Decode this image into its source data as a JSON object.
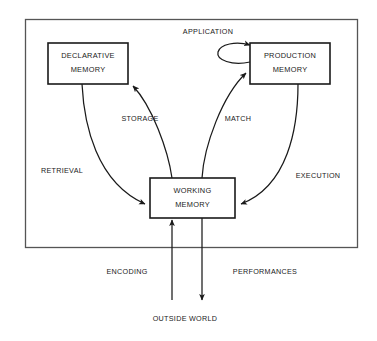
{
  "diagram": {
    "boundary": {
      "name": "cognitive-system-boundary"
    },
    "colors": {
      "background": "#ffffff",
      "box_stroke": "#1a1a1a",
      "boundary_stroke": "#555555",
      "arrow": "#1a1a1a",
      "text": "#1a1a1a"
    },
    "nodes": [
      {
        "id": "declarative-memory",
        "line1": "DECLARATIVE",
        "line2": "MEMORY",
        "x": 48,
        "y": 43,
        "w": 80,
        "h": 41
      },
      {
        "id": "production-memory",
        "line1": "PRODUCTION",
        "line2": "MEMORY",
        "x": 250,
        "y": 43,
        "w": 80,
        "h": 41
      },
      {
        "id": "working-memory",
        "line1": "WORKING",
        "line2": "MEMORY",
        "x": 150,
        "y": 178,
        "w": 85,
        "h": 40
      }
    ],
    "edges": [
      {
        "id": "application",
        "label": "APPLICATION",
        "from": "production-memory",
        "to": "production-memory",
        "lx": 208,
        "ly": 32
      },
      {
        "id": "storage",
        "label": "STORAGE",
        "from": "working-memory",
        "to": "declarative-memory",
        "lx": 140,
        "ly": 119
      },
      {
        "id": "match",
        "label": "MATCH",
        "from": "working-memory",
        "to": "production-memory",
        "lx": 238,
        "ly": 119
      },
      {
        "id": "retrieval",
        "label": "RETRIEVAL",
        "from": "declarative-memory",
        "to": "working-memory",
        "lx": 62,
        "ly": 171
      },
      {
        "id": "execution",
        "label": "EXECUTION",
        "from": "production-memory",
        "to": "working-memory",
        "lx": 318,
        "ly": 176
      },
      {
        "id": "encoding",
        "label": "ENCODING",
        "from": "outside-world",
        "to": "working-memory",
        "lx": 127,
        "ly": 272
      },
      {
        "id": "performances",
        "label": "PERFORMANCES",
        "from": "working-memory",
        "to": "outside-world",
        "lx": 265,
        "ly": 272
      }
    ],
    "world": {
      "id": "outside-world",
      "label": "OUTSIDE WORLD",
      "lx": 185,
      "ly": 319
    }
  }
}
